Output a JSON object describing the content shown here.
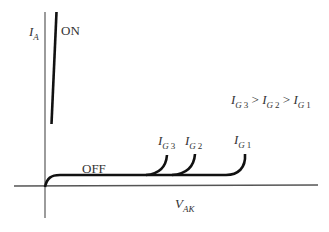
{
  "diagram": {
    "type": "thyristor I-V characteristic",
    "y_axis": {
      "symbol": "I",
      "subscript": "A"
    },
    "x_axis": {
      "symbol": "V",
      "subscript": "AK"
    },
    "labels": {
      "on": "ON",
      "off": "OFF"
    },
    "curves": [
      {
        "symbol": "I",
        "subscript": "G",
        "index": "3"
      },
      {
        "symbol": "I",
        "subscript": "G",
        "index": "2"
      },
      {
        "symbol": "I",
        "subscript": "G",
        "index": "1"
      }
    ],
    "relation": {
      "terms": [
        {
          "symbol": "I",
          "subscript": "G",
          "index": "3"
        },
        {
          "symbol": "I",
          "subscript": "G",
          "index": "2"
        },
        {
          "symbol": "I",
          "subscript": "G",
          "index": "1"
        }
      ],
      "operator": ">"
    },
    "colors": {
      "curve": "#111111",
      "axis": "#555555"
    }
  }
}
